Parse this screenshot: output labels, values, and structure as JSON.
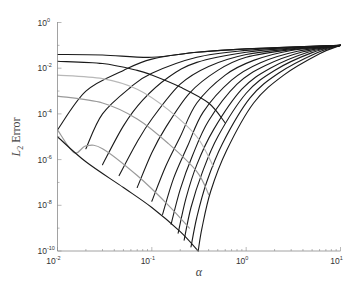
{
  "chart_data": {
    "type": "line",
    "title": "",
    "xlabel": "α",
    "ylabel": "L2 Error",
    "ylabel_parts": {
      "main": "L",
      "sub": "2",
      "rest": " Error"
    },
    "xscale": "log",
    "yscale": "log",
    "xlim": [
      0.01,
      10
    ],
    "ylim": [
      1e-10,
      1
    ],
    "grid": false,
    "legend": null,
    "x_ticks": [
      {
        "base": "10",
        "exp": "-2",
        "value": 0.01
      },
      {
        "base": "10",
        "exp": "-1",
        "value": 0.1
      },
      {
        "base": "10",
        "exp": "0",
        "value": 1
      },
      {
        "base": "10",
        "exp": "1",
        "value": 10
      }
    ],
    "y_ticks": [
      {
        "base": "10",
        "exp": "0",
        "value": 1
      },
      {
        "base": "10",
        "exp": "-2",
        "value": 0.01
      },
      {
        "base": "10",
        "exp": "-4",
        "value": 0.0001
      },
      {
        "base": "10",
        "exp": "-6",
        "value": 1e-06
      },
      {
        "base": "10",
        "exp": "-8",
        "value": 1e-08
      },
      {
        "base": "10",
        "exp": "-10",
        "value": 1e-10
      }
    ],
    "convergence_point": {
      "alpha": 10,
      "error": 0.1
    },
    "minimum_point": {
      "alpha": 0.31,
      "error": 1e-10
    },
    "series": [
      {
        "name": "rising-1",
        "color": "#1a1a1a",
        "points": [
          [
            0.01,
            2e-05
          ],
          [
            0.02,
            0.001
          ],
          [
            0.05,
            0.008
          ],
          [
            0.1,
            0.025
          ],
          [
            0.3,
            0.05
          ],
          [
            1,
            0.07
          ],
          [
            3,
            0.085
          ],
          [
            10,
            0.1
          ]
        ]
      },
      {
        "name": "rising-2",
        "color": "#1a1a1a",
        "points": [
          [
            0.02,
            3e-06
          ],
          [
            0.03,
            0.0001
          ],
          [
            0.06,
            0.0015
          ],
          [
            0.1,
            0.006
          ],
          [
            0.3,
            0.03
          ],
          [
            1,
            0.06
          ],
          [
            3,
            0.08
          ],
          [
            10,
            0.1
          ]
        ]
      },
      {
        "name": "rising-3",
        "color": "#1a1a1a",
        "points": [
          [
            0.03,
            6e-07
          ],
          [
            0.05,
            3e-05
          ],
          [
            0.08,
            0.0004
          ],
          [
            0.15,
            0.004
          ],
          [
            0.3,
            0.018
          ],
          [
            1,
            0.05
          ],
          [
            3,
            0.075
          ],
          [
            10,
            0.1
          ]
        ]
      },
      {
        "name": "rising-4",
        "color": "#1a1a1a",
        "points": [
          [
            0.045,
            2e-07
          ],
          [
            0.07,
            6e-06
          ],
          [
            0.1,
            6e-05
          ],
          [
            0.2,
            0.002
          ],
          [
            0.4,
            0.012
          ],
          [
            1,
            0.04
          ],
          [
            3,
            0.07
          ],
          [
            10,
            0.1
          ]
        ]
      },
      {
        "name": "rising-5",
        "color": "#1a1a1a",
        "points": [
          [
            0.07,
            6e-08
          ],
          [
            0.1,
            2e-06
          ],
          [
            0.14,
            2.5e-05
          ],
          [
            0.25,
            0.0008
          ],
          [
            0.5,
            0.008
          ],
          [
            1,
            0.03
          ],
          [
            3,
            0.065
          ],
          [
            10,
            0.1
          ]
        ]
      },
      {
        "name": "rising-6",
        "color": "#1a1a1a",
        "points": [
          [
            0.1,
            1.5e-08
          ],
          [
            0.14,
            5e-07
          ],
          [
            0.2,
            1e-05
          ],
          [
            0.3,
            0.0003
          ],
          [
            0.6,
            0.005
          ],
          [
            1.2,
            0.022
          ],
          [
            3,
            0.06
          ],
          [
            10,
            0.1
          ]
        ]
      },
      {
        "name": "rising-7",
        "color": "#1a1a1a",
        "points": [
          [
            0.13,
            4e-09
          ],
          [
            0.17,
            1.5e-07
          ],
          [
            0.24,
            4e-06
          ],
          [
            0.35,
            0.00012
          ],
          [
            0.7,
            0.003
          ],
          [
            1.4,
            0.017
          ],
          [
            3.5,
            0.055
          ],
          [
            10,
            0.1
          ]
        ]
      },
      {
        "name": "rising-8",
        "color": "#1a1a1a",
        "points": [
          [
            0.16,
            1.5e-09
          ],
          [
            0.2,
            5e-08
          ],
          [
            0.27,
            1.5e-06
          ],
          [
            0.4,
            5e-05
          ],
          [
            0.8,
            0.002
          ],
          [
            1.6,
            0.013
          ],
          [
            4,
            0.052
          ],
          [
            10,
            0.1
          ]
        ]
      },
      {
        "name": "rising-9",
        "color": "#1a1a1a",
        "points": [
          [
            0.19,
            6e-10
          ],
          [
            0.23,
            2e-08
          ],
          [
            0.3,
            6e-07
          ],
          [
            0.45,
            2e-05
          ],
          [
            0.9,
            0.0012
          ],
          [
            1.8,
            0.01
          ],
          [
            4.5,
            0.05
          ],
          [
            10,
            0.1
          ]
        ]
      },
      {
        "name": "rising-10",
        "color": "#1a1a1a",
        "points": [
          [
            0.22,
            3e-10
          ],
          [
            0.26,
            8e-09
          ],
          [
            0.34,
            2.5e-07
          ],
          [
            0.5,
            1e-05
          ],
          [
            1,
            0.0008
          ],
          [
            2,
            0.008
          ],
          [
            5,
            0.048
          ],
          [
            10,
            0.1
          ]
        ]
      },
      {
        "name": "rising-11",
        "color": "#1a1a1a",
        "points": [
          [
            0.26,
            1.5e-10
          ],
          [
            0.3,
            3e-09
          ],
          [
            0.38,
            1e-07
          ],
          [
            0.56,
            5e-06
          ],
          [
            1.1,
            0.0005
          ],
          [
            2.2,
            0.006
          ],
          [
            5.5,
            0.045
          ],
          [
            10,
            0.1
          ]
        ]
      },
      {
        "name": "rising-12",
        "color": "#1a1a1a",
        "points": [
          [
            0.31,
            1e-10
          ],
          [
            0.34,
            1e-09
          ],
          [
            0.42,
            4e-08
          ],
          [
            0.62,
            2.5e-06
          ],
          [
            1.2,
            0.0003
          ],
          [
            2.5,
            0.005
          ],
          [
            6,
            0.043
          ],
          [
            10,
            0.1
          ]
        ]
      },
      {
        "name": "descending-1",
        "color": "#1a1a1a",
        "points": [
          [
            0.01,
            0.04
          ],
          [
            0.03,
            0.038
          ],
          [
            0.1,
            0.03
          ],
          [
            0.3,
            0.05
          ],
          [
            1,
            0.07
          ],
          [
            10,
            0.1
          ]
        ]
      },
      {
        "name": "descending-2",
        "color": "#1a1a1a",
        "points": [
          [
            0.01,
            0.02
          ],
          [
            0.03,
            0.016
          ],
          [
            0.07,
            0.008
          ],
          [
            0.1,
            0.005
          ],
          [
            0.2,
            0.0015
          ],
          [
            0.4,
            0.0003
          ],
          [
            0.6,
            4e-05
          ]
        ]
      },
      {
        "name": "descending-3",
        "color": "#b8b8b8",
        "points": [
          [
            0.01,
            0.005
          ],
          [
            0.03,
            0.0035
          ],
          [
            0.07,
            0.0012
          ],
          [
            0.15,
            0.00015
          ],
          [
            0.3,
            1e-05
          ],
          [
            0.45,
            5e-07
          ]
        ]
      },
      {
        "name": "descending-4",
        "color": "#9a9a9a",
        "points": [
          [
            0.01,
            0.0006
          ],
          [
            0.03,
            0.0003
          ],
          [
            0.07,
            6e-05
          ],
          [
            0.15,
            5e-06
          ],
          [
            0.3,
            3e-07
          ],
          [
            0.4,
            3e-08
          ]
        ]
      },
      {
        "name": "descending-5",
        "color": "#9a9a9a",
        "points": [
          [
            0.01,
            2e-05
          ],
          [
            0.015,
            2e-06
          ],
          [
            0.02,
            4e-06
          ],
          [
            0.03,
            3e-06
          ],
          [
            0.07,
            2e-07
          ],
          [
            0.15,
            1e-08
          ],
          [
            0.25,
            1e-09
          ]
        ]
      },
      {
        "name": "lower-envelope",
        "color": "#1a1a1a",
        "points": [
          [
            0.01,
            1e-05
          ],
          [
            0.02,
            8e-07
          ],
          [
            0.05,
            6e-08
          ],
          [
            0.1,
            8e-09
          ],
          [
            0.2,
            7e-10
          ],
          [
            0.31,
            1e-10
          ]
        ]
      }
    ]
  }
}
